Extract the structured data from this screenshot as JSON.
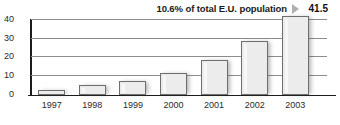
{
  "annotation": {
    "text": "10.6% of total E.U. population",
    "arrow_icon": "triangle-right-icon",
    "value": "41.5"
  },
  "axis": {
    "y_ticks": [
      "0",
      "10",
      "20",
      "30",
      "40"
    ],
    "x_labels": [
      "1997",
      "1998",
      "1999",
      "2000",
      "2001",
      "2002",
      "2003"
    ]
  },
  "colors": {
    "bar_fill": "#ececed",
    "bar_border": "#6e6e6e",
    "axis": "#1c1c1c",
    "gridline": "#8c8c8c",
    "arrow": "#b0b0b0",
    "text": "#1a1a1a"
  },
  "chart_data": {
    "type": "bar",
    "title": "",
    "subtitle": "",
    "xlabel": "",
    "ylabel": "",
    "categories": [
      "1997",
      "1998",
      "1999",
      "2000",
      "2001",
      "2002",
      "2003"
    ],
    "values": [
      2.3,
      5.0,
      7.4,
      11.3,
      18.2,
      28.2,
      41.5
    ],
    "ylim": [
      0,
      40
    ],
    "ytick_values": [
      0,
      10,
      20,
      30,
      40
    ],
    "grid": true,
    "legend": "none",
    "annotations": [
      {
        "text": "10.6% of total E.U. population",
        "value": "41.5",
        "position": "top-right",
        "refers_to_category": "2003"
      }
    ]
  }
}
